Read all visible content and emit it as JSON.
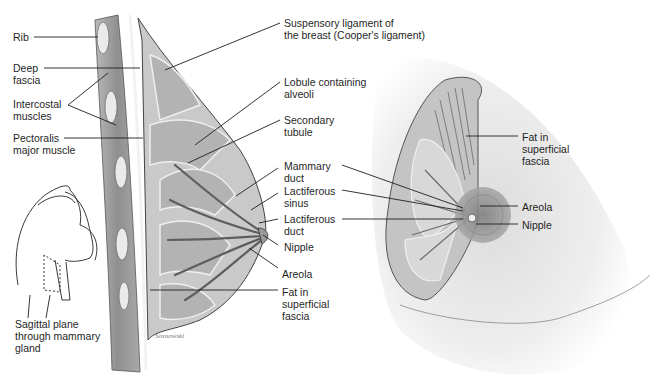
{
  "figure": {
    "left_panel": {
      "description": "Sagittal section of breast",
      "labels_left": [
        {
          "id": "rib",
          "lines": [
            "Rib"
          ]
        },
        {
          "id": "deep-fascia",
          "lines": [
            "Deep",
            "fascia"
          ]
        },
        {
          "id": "intercostal-muscles",
          "lines": [
            "Intercostal",
            "muscles"
          ]
        },
        {
          "id": "pectoralis-major-muscle",
          "lines": [
            "Pectoralis",
            "major muscle"
          ]
        }
      ],
      "labels_right": [
        {
          "id": "suspensory-ligament",
          "lines": [
            "Suspensory ligament of",
            "the breast (Cooper's ligament)"
          ]
        },
        {
          "id": "lobule-containing-alveoli",
          "lines": [
            "Lobule containing",
            "alveoli"
          ]
        },
        {
          "id": "secondary-tubule",
          "lines": [
            "Secondary",
            "tubule"
          ]
        },
        {
          "id": "mammary-duct",
          "lines": [
            "Mammary",
            "duct"
          ]
        },
        {
          "id": "lactiferous-sinus",
          "lines": [
            "Lactiferous",
            "sinus"
          ]
        },
        {
          "id": "lactiferous-duct",
          "lines": [
            "Lactiferous",
            "duct"
          ]
        },
        {
          "id": "nipple",
          "lines": [
            "Nipple"
          ]
        },
        {
          "id": "areola",
          "lines": [
            "Areola"
          ]
        },
        {
          "id": "fat-in-superficial-fascia",
          "lines": [
            "Fat in",
            "superficial",
            "fascia"
          ]
        }
      ],
      "inset_caption": [
        "Sagittal plane",
        "through mammary",
        "gland"
      ],
      "signature": "Sosnowski"
    },
    "right_panel": {
      "description": "Anterior view of dissected breast",
      "labels": [
        {
          "id": "fat-in-superficial-fascia-right",
          "lines": [
            "Fat in",
            "superficial",
            "fascia"
          ]
        },
        {
          "id": "areola-right",
          "lines": [
            "Areola"
          ]
        },
        {
          "id": "nipple-right",
          "lines": [
            "Nipple"
          ]
        }
      ]
    },
    "colors": {
      "background": "#ffffff",
      "tissue_light": "#d9d9d9",
      "tissue_mid": "#a8a8a8",
      "tissue_dark": "#6e6e6e",
      "line": "#1f1f1f",
      "skin_shade": "#e6e6e6"
    }
  }
}
